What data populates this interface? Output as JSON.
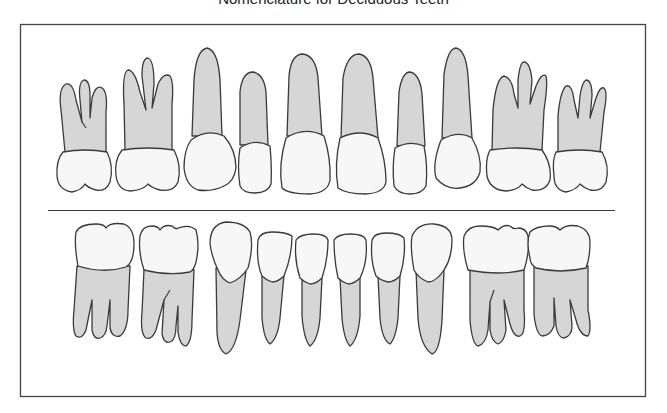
{
  "figure": {
    "title": "Nomenclature for Deciduous Teeth",
    "title_clipped": true
  },
  "colors": {
    "root_fill": "#d6d6d6",
    "crown_fill": "#f7f7f7",
    "outline": "#3a3a3a",
    "background": "#ffffff"
  },
  "arches": {
    "upper": {
      "label": "Maxillary arch",
      "teeth": [
        "Second molar",
        "First molar",
        "Canine",
        "Lateral incisor",
        "Central incisor",
        "Central incisor",
        "Lateral incisor",
        "Canine",
        "First molar",
        "Second molar"
      ]
    },
    "lower": {
      "label": "Mandibular arch",
      "teeth": [
        "Second molar",
        "First molar",
        "Canine",
        "Lateral incisor",
        "Central incisor",
        "Central incisor",
        "Lateral incisor",
        "Canine",
        "First molar",
        "Second molar"
      ]
    }
  }
}
